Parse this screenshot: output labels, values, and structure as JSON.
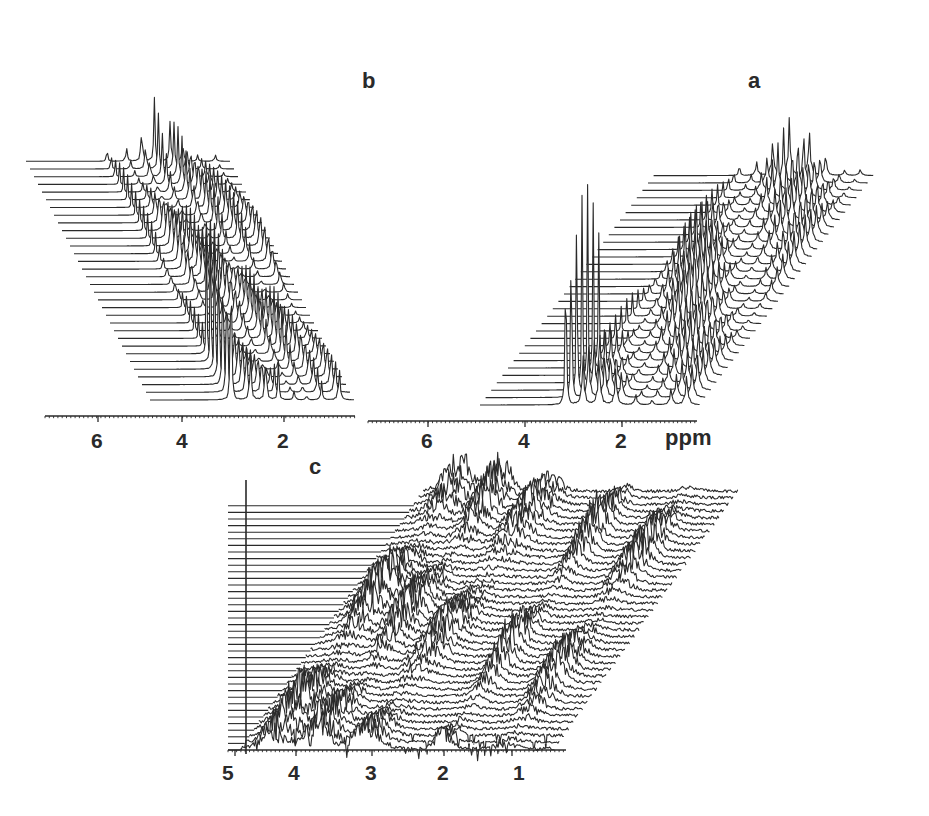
{
  "figure": {
    "ink_color": "#2a2a2a",
    "background": "#ffffff"
  },
  "chart_data": [
    {
      "type": "line",
      "panel": "b",
      "title": "b",
      "xlabel": "",
      "x_unit": "ppm",
      "x_reversed": true,
      "x_ticks": [
        6,
        4,
        2
      ],
      "xlim": [
        7.4,
        0.7
      ],
      "n_traces": 32,
      "layout": {
        "x0": 150,
        "x1": 355,
        "y_base": 400,
        "dx": -4.0,
        "dy": -7.7,
        "axis_y": 416,
        "axis_x0": 45,
        "axis_x1": 355
      },
      "tick_px": [
        98,
        182,
        284
      ],
      "label_pos": {
        "x": 362,
        "y": 78
      },
      "peaks": [
        {
          "ppm": 4.75,
          "height": 330,
          "width": 0.03,
          "note": "tall water/HDO peak, decays across first traces"
        },
        {
          "ppm": 4.1,
          "height": 60,
          "width": 0.06
        },
        {
          "ppm": 3.6,
          "height": 55,
          "width": 0.06
        },
        {
          "ppm": 3.2,
          "height": 65,
          "width": 0.05
        },
        {
          "ppm": 2.7,
          "height": 50,
          "width": 0.06
        },
        {
          "ppm": 2.3,
          "height": 55,
          "width": 0.05
        },
        {
          "ppm": 1.8,
          "height": 45,
          "width": 0.06
        },
        {
          "ppm": 1.2,
          "height": 40,
          "width": 0.07
        }
      ]
    },
    {
      "type": "line",
      "panel": "a",
      "title": "a",
      "xlabel": "ppm",
      "x_unit": "ppm",
      "x_reversed": true,
      "x_ticks": [
        6,
        4,
        2
      ],
      "xlim": [
        7.4,
        0.6
      ],
      "n_traces": 32,
      "layout": {
        "x0": 480,
        "x1": 700,
        "y_base": 405,
        "dx": 5.6,
        "dy": -7.4,
        "axis_y": 421,
        "axis_x0": 368,
        "axis_x1": 697
      },
      "tick_px": [
        428,
        525,
        622
      ],
      "label_pos": {
        "x": 748,
        "y": 76
      },
      "peaks": [
        {
          "ppm": 4.75,
          "height": 330,
          "width": 0.03,
          "note": "tall water/HDO peak, decays across first traces"
        },
        {
          "ppm": 4.2,
          "height": 55,
          "width": 0.08
        },
        {
          "ppm": 3.7,
          "height": 50,
          "width": 0.09
        },
        {
          "ppm": 3.2,
          "height": 60,
          "width": 0.08
        },
        {
          "ppm": 2.6,
          "height": 50,
          "width": 0.09
        },
        {
          "ppm": 2.1,
          "height": 45,
          "width": 0.08
        },
        {
          "ppm": 1.5,
          "height": 40,
          "width": 0.09
        },
        {
          "ppm": 1.0,
          "height": 35,
          "width": 0.1
        }
      ]
    },
    {
      "type": "line",
      "panel": "c",
      "title": "c",
      "xlabel": "",
      "x_unit": "ppm",
      "x_reversed": true,
      "x_ticks": [
        5,
        4,
        3,
        2,
        1
      ],
      "xlim": [
        5.1,
        0.6
      ],
      "n_traces": 40,
      "layout": {
        "x0": 240,
        "x1": 555,
        "y_base": 750,
        "dx": 4.7,
        "dy": -6.6,
        "axis_y": 750,
        "axis_x0": 228,
        "axis_x1": 566
      },
      "tick_px": [
        235,
        296,
        372,
        444,
        512
      ],
      "label_pos": {
        "x": 309,
        "y": 463
      },
      "vertical_marker_x": 246,
      "peaks": [
        {
          "ppm": 4.6,
          "height": 40,
          "width": 0.25,
          "noisy": true
        },
        {
          "ppm": 4.0,
          "height": 38,
          "width": 0.2,
          "noisy": true
        },
        {
          "ppm": 3.3,
          "height": 30,
          "width": 0.25,
          "noisy": true
        },
        {
          "ppm": 2.2,
          "height": 35,
          "width": 0.15,
          "noisy": true
        },
        {
          "ppm": 1.3,
          "height": 32,
          "width": 0.2,
          "noisy": true
        }
      ]
    }
  ],
  "labels": {
    "panel_a": "a",
    "panel_b": "b",
    "panel_c": "c",
    "ppm_unit": "ppm",
    "ticks_b": [
      "6",
      "4",
      "2"
    ],
    "ticks_a": [
      "6",
      "4",
      "2"
    ],
    "ticks_c": [
      "5",
      "4",
      "3",
      "2",
      "1"
    ]
  }
}
